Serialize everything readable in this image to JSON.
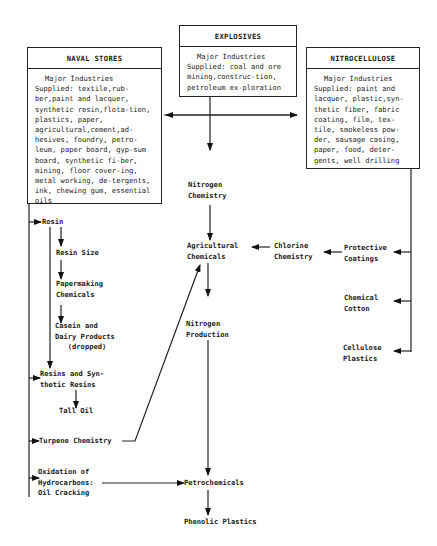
{
  "boxes": {
    "naval_stores": {
      "title": "NAVAL STORES",
      "lead": "Major Industries",
      "body": "Supplied: textile,rub-ber,paint and lacquer, synthetic resin,flota-tion, plastics, paper, agricultural,cement,ad-hesives, foundry, petro-leum, paper board, gyp-sum board, synthetic fi-ber, mining, floor cover-ing, metal working, de-tergents, ink, chewing gum, essential oils"
    },
    "explosives": {
      "title": "EXPLOSIVES",
      "lead": "Major Industries",
      "body": "Supplied: coal and ore mining,construc-tion, petroleum ex-ploration"
    },
    "nitrocellulose": {
      "title": "NITROCELLULOSE",
      "lead": "Major Industries",
      "body": "Supplied: paint and lacquer, plastic,syn-thetic fiber, fabric coating, film, tex-tile, smokeless pow-der, sausage casing, paper, food, deter-gents, well drilling"
    }
  },
  "nodes": {
    "rosin": "Rosin",
    "resin_size": "Resin Size",
    "papermaking": "Papermaking\nChemicals",
    "casein": "Casein and\nDairy Products\n   (dropped)",
    "resins_synthetic": "Resins and Syn-\nthetic Resins",
    "tall_oil": "Tall Oil",
    "turpene": "Turpene Chemistry",
    "oxidation": "Oxidation of\nHydrocarbons:\nOil Cracking",
    "nitrogen_chemistry": "Nitrogen\nChemistry",
    "agricultural": "Agricultural\nChemicals",
    "nitrogen_production": "Nitrogen\nProduction",
    "petrochemicals": "Petrochemicals",
    "phenolic": "Phenolic Plastics",
    "chlorine": "Chlorine\nChemistry",
    "protective": "Protective\nCoatings",
    "chemical_cotton": "Chemical\nCotton",
    "cellulose_plastics": "Cellulose\nPlastics"
  }
}
